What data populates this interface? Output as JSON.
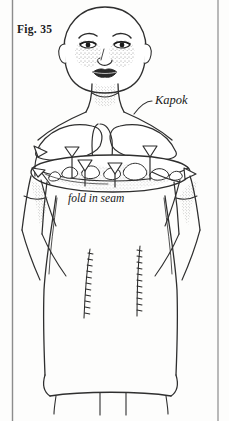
{
  "figure": {
    "number_label": "Fig. 35",
    "caption_kapok": "Kapok",
    "caption_fold": "fold in seam",
    "colors": {
      "background": "#fdfdfc",
      "ink": "#2f2f2f",
      "text": "#181818",
      "border": "#8c8c8c",
      "stipple": "#3a3a3a"
    }
  },
  "frame": {
    "left_rule_x": 12,
    "right_rule_x": 218
  },
  "annotations": [
    {
      "name": "kapok-leader-line",
      "label": "Kapok",
      "points_to": "neck-opening"
    },
    {
      "name": "fold-in-seam-label",
      "label": "fold in seam",
      "points_to": "shoulder-seam"
    }
  ],
  "arrows": [
    {
      "name": "arrow-left-outer",
      "direction": "left"
    },
    {
      "name": "arrow-left-inner",
      "direction": "down"
    },
    {
      "name": "arrow-center-left",
      "direction": "down"
    },
    {
      "name": "arrow-center",
      "direction": "down"
    },
    {
      "name": "arrow-center-right",
      "direction": "down"
    },
    {
      "name": "arrow-right-inner",
      "direction": "down"
    },
    {
      "name": "arrow-right-outer",
      "direction": "right"
    }
  ],
  "seams": [
    {
      "name": "dart-seam-left"
    },
    {
      "name": "dart-seam-right"
    }
  ]
}
